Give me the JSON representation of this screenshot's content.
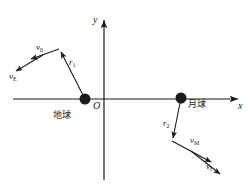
{
  "figure": {
    "type": "physics-vector-diagram",
    "background_color": "#ffffff",
    "stroke_color": "#1a1a1a",
    "width": 252,
    "height": 192
  },
  "axes": {
    "x_label": "x",
    "y_label": "y",
    "origin_label": "O",
    "x_axis": {
      "x1": 13,
      "y1": 99,
      "x2": 240,
      "y2": 99
    },
    "y_axis": {
      "x1": 104,
      "y1": 180,
      "x2": 104,
      "y2": 18
    }
  },
  "bodies": [
    {
      "id": "earth",
      "label": "地球",
      "label_x": 53,
      "label_y": 112,
      "cx": 85,
      "cy": 99,
      "r": 5.5,
      "color": "#1a1a1a"
    },
    {
      "id": "moon",
      "label": "月球",
      "label_x": 188,
      "label_y": 101,
      "cx": 181,
      "cy": 98,
      "r": 5.5,
      "color": "#1a1a1a"
    }
  ],
  "vectors": [
    {
      "id": "r1",
      "label": "r",
      "subscript": "1",
      "label_x": 69,
      "label_y": 62,
      "x1": 85,
      "y1": 99,
      "x2": 60,
      "y2": 50
    },
    {
      "id": "v0",
      "label": "v",
      "subscript": "0",
      "label_x": 35,
      "label_y": 47,
      "x1": 60,
      "y1": 50,
      "x2": 29,
      "y2": 60
    },
    {
      "id": "vE",
      "label": "v",
      "subscript": "E",
      "label_x": 9,
      "label_y": 76,
      "x1": 43,
      "y1": 55,
      "x2": 14,
      "y2": 72
    },
    {
      "id": "r2",
      "label": "r",
      "subscript": "2",
      "label_x": 166,
      "label_y": 123,
      "x1": 181,
      "y1": 98,
      "x2": 172,
      "y2": 140
    },
    {
      "id": "vM",
      "label": "v",
      "subscript": "M",
      "label_x": 190,
      "label_y": 140,
      "x1": 172,
      "y1": 140,
      "x2": 213,
      "y2": 163
    },
    {
      "id": "vf",
      "label": "v",
      "subscript": "f",
      "label_x": 206,
      "label_y": 166,
      "x1": 191,
      "y1": 151,
      "x2": 222,
      "y2": 175
    }
  ]
}
